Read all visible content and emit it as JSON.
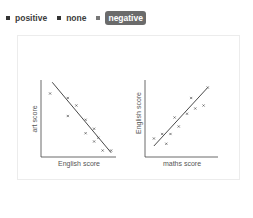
{
  "options": {
    "items": [
      {
        "label": "positive",
        "selected": false
      },
      {
        "label": "none",
        "selected": false
      },
      {
        "label": "negative",
        "selected": true
      }
    ]
  },
  "chart_data": [
    {
      "type": "scatter",
      "title": "",
      "xlabel": "English score",
      "ylabel": "art score",
      "xlim": [
        0,
        10
      ],
      "ylim": [
        0,
        10
      ],
      "grid": false,
      "points": [
        {
          "x": 1.0,
          "y": 8.2
        },
        {
          "x": 3.5,
          "y": 7.6
        },
        {
          "x": 3.5,
          "y": 5.2
        },
        {
          "x": 4.7,
          "y": 6.6
        },
        {
          "x": 6.0,
          "y": 4.7
        },
        {
          "x": 6.0,
          "y": 2.9
        },
        {
          "x": 7.2,
          "y": 3.5
        },
        {
          "x": 7.2,
          "y": 1.8
        },
        {
          "x": 7.8,
          "y": 2.3
        },
        {
          "x": 8.4,
          "y": 0.6
        },
        {
          "x": 9.6,
          "y": 0.6
        }
      ],
      "trendline": {
        "from": {
          "x": 1.3,
          "y": 9.7
        },
        "to": {
          "x": 9.6,
          "y": 0.3
        }
      }
    },
    {
      "type": "scatter",
      "title": "",
      "xlabel": "maths score",
      "ylabel": "English score",
      "xlim": [
        0,
        10
      ],
      "ylim": [
        0,
        10
      ],
      "grid": false,
      "points": [
        {
          "x": 1.0,
          "y": 2.2
        },
        {
          "x": 2.2,
          "y": 2.8
        },
        {
          "x": 2.8,
          "y": 1.5
        },
        {
          "x": 3.4,
          "y": 2.8
        },
        {
          "x": 4.0,
          "y": 5.0
        },
        {
          "x": 4.6,
          "y": 3.8
        },
        {
          "x": 5.8,
          "y": 5.5
        },
        {
          "x": 6.4,
          "y": 7.6
        },
        {
          "x": 7.0,
          "y": 6.2
        },
        {
          "x": 8.2,
          "y": 6.6
        },
        {
          "x": 8.8,
          "y": 9.0
        }
      ],
      "trendline": {
        "from": {
          "x": 1.0,
          "y": 1.2
        },
        "to": {
          "x": 8.8,
          "y": 9.0
        }
      }
    }
  ]
}
